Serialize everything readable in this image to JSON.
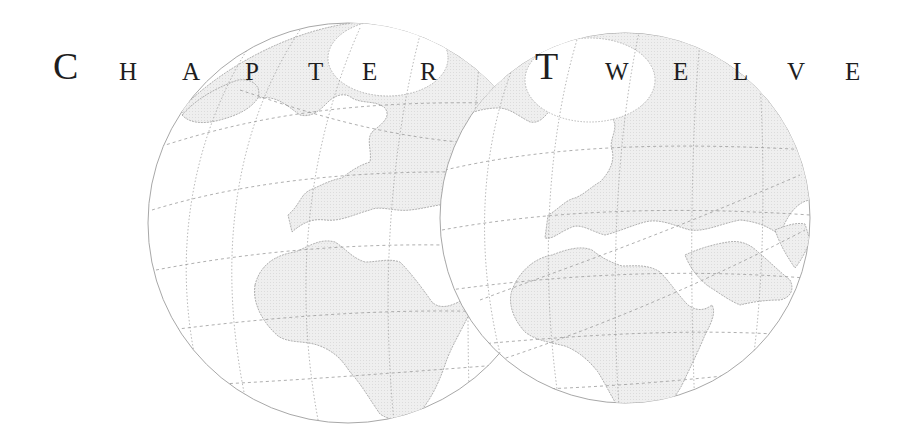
{
  "heading": {
    "word1": "CHAPTER",
    "word2": "TWELVE",
    "letters": [
      {
        "char": "C",
        "size": "big",
        "x": 53,
        "y": 47
      },
      {
        "char": "H",
        "size": "small",
        "x": 119,
        "y": 59
      },
      {
        "char": "A",
        "size": "small",
        "x": 182,
        "y": 59
      },
      {
        "char": "P",
        "size": "small",
        "x": 245,
        "y": 59
      },
      {
        "char": "T",
        "size": "small",
        "x": 308,
        "y": 59
      },
      {
        "char": "E",
        "size": "small",
        "x": 362,
        "y": 59
      },
      {
        "char": "R",
        "size": "small",
        "x": 420,
        "y": 59
      },
      {
        "char": "T",
        "size": "big",
        "x": 535,
        "y": 47
      },
      {
        "char": "W",
        "size": "small",
        "x": 605,
        "y": 59
      },
      {
        "char": "E",
        "size": "small",
        "x": 673,
        "y": 59
      },
      {
        "char": "L",
        "size": "small",
        "x": 733,
        "y": 59
      },
      {
        "char": "V",
        "size": "small",
        "x": 787,
        "y": 59
      },
      {
        "char": "E",
        "size": "small",
        "x": 845,
        "y": 59
      }
    ]
  },
  "illustration": {
    "description": "Two overlapping orthographic globe maps showing Europe, Africa and the Arctic with dotted graticule lines",
    "land_color": "#ececec",
    "line_color": "#9a9a9a",
    "globes": [
      {
        "cx": 348,
        "cy": 223,
        "r": 200
      },
      {
        "cx": 625,
        "cy": 218,
        "r": 185
      }
    ]
  }
}
